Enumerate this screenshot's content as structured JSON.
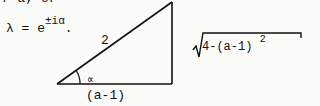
{
  "document": {
    "top_fragment": "r a, or",
    "equation": {
      "lhs": "λ = e",
      "exponent": "±iα",
      "trailing": "."
    },
    "triangle": {
      "hypotenuse_label": "2",
      "angle_label": "∝",
      "base_label": "(a-1)",
      "height_expression": {
        "radicand": "4-(a-1)",
        "power": "2"
      }
    }
  }
}
